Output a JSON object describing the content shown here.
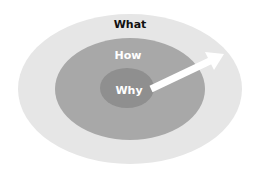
{
  "diagram": {
    "type": "golden-circle",
    "colors": {
      "outer": "#e6e6e6",
      "middle": "#a8a8a8",
      "inner": "#8f8f8f",
      "arrow": "#ffffff",
      "outer_text": "#111111",
      "inner_text": "#ffffff"
    },
    "layers": [
      {
        "label": "What",
        "cx": 130,
        "cy": 89,
        "rx": 112,
        "ry": 75
      },
      {
        "label": "How",
        "cx": 130,
        "cy": 89,
        "rx": 75,
        "ry": 51
      },
      {
        "label": "Why",
        "cx": 127,
        "cy": 88,
        "rx": 27,
        "ry": 20
      }
    ],
    "arrow": {
      "from": [
        150,
        89
      ],
      "to": [
        224,
        54
      ]
    }
  }
}
